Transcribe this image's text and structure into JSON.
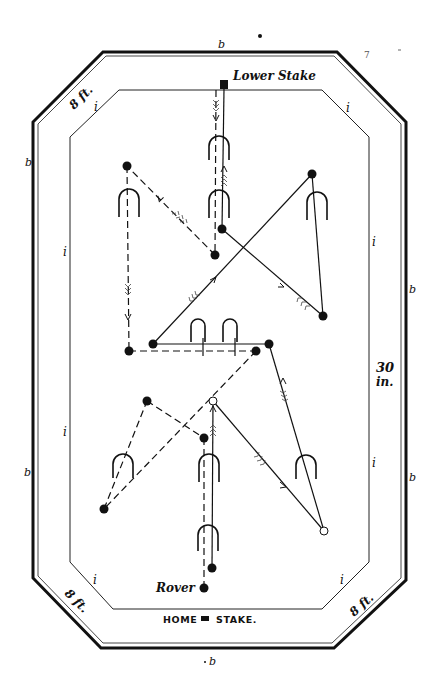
{
  "diagram": {
    "labels": {
      "lower_stake": "Lower Stake",
      "home_stake_left": "HOME",
      "home_stake_right": "STAKE.",
      "rover": "Rover",
      "corner_top_left": "8 ft.",
      "corner_bottom_left": "8 ft.",
      "corner_bottom_right": "8 ft.",
      "width_value": "30",
      "width_unit": "in.",
      "boundary_marker": "b",
      "inner_marker": "i",
      "stray_mark": "7"
    },
    "boundaries": {
      "outer": "b",
      "inner": "i"
    },
    "stakes": [
      {
        "name": "Lower Stake",
        "x": 224,
        "y": 85
      },
      {
        "name": "HOME STAKE",
        "x": 204,
        "y": 619
      }
    ],
    "wickets": [
      {
        "x": 219,
        "y": 140
      },
      {
        "x": 129,
        "y": 197
      },
      {
        "x": 219,
        "y": 198
      },
      {
        "x": 318,
        "y": 200
      },
      {
        "x": 198,
        "y": 328
      },
      {
        "x": 230,
        "y": 328
      },
      {
        "x": 123,
        "y": 465
      },
      {
        "x": 210,
        "y": 462
      },
      {
        "x": 306,
        "y": 466
      },
      {
        "x": 209,
        "y": 533
      }
    ],
    "balls": [
      {
        "x": 127,
        "y": 166,
        "type": "solid"
      },
      {
        "x": 215,
        "y": 255,
        "type": "solid"
      },
      {
        "x": 222,
        "y": 229,
        "type": "solid"
      },
      {
        "x": 312,
        "y": 174,
        "type": "solid"
      },
      {
        "x": 323,
        "y": 316,
        "type": "solid"
      },
      {
        "x": 129,
        "y": 351,
        "type": "solid"
      },
      {
        "x": 153,
        "y": 344,
        "type": "solid"
      },
      {
        "x": 256,
        "y": 351,
        "type": "solid"
      },
      {
        "x": 269,
        "y": 344,
        "type": "solid"
      },
      {
        "x": 147,
        "y": 401,
        "type": "solid"
      },
      {
        "x": 204,
        "y": 438,
        "type": "solid"
      },
      {
        "x": 104,
        "y": 509,
        "type": "solid"
      },
      {
        "x": 212,
        "y": 568,
        "type": "solid"
      },
      {
        "x": 204,
        "y": 588,
        "type": "solid"
      },
      {
        "x": 213,
        "y": 401,
        "type": "open"
      },
      {
        "x": 324,
        "y": 531,
        "type": "open"
      }
    ]
  }
}
